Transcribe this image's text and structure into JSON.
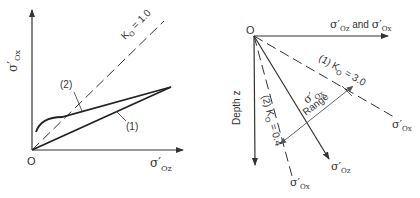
{
  "left_panel": {
    "y_axis_label": "σ′",
    "y_axis_sub": "Ox",
    "x_axis_label": "σ′",
    "x_axis_sub": "Oz",
    "origin_label": "O",
    "k0_line_label": "K",
    "k0_line_sub": "O",
    "k0_line_value": " = 1.0",
    "curve1_label": "(1)",
    "curve2_label": "(2)"
  },
  "right_panel": {
    "origin_label": "O",
    "horizontal_axis_label_a": "σ′",
    "horizontal_axis_sub_a": "Oz",
    "horizontal_axis_and": " and ",
    "horizontal_axis_label_b": "σ′",
    "horizontal_axis_sub_b": "Ox",
    "depth_label": "Depth  z",
    "line1_label": "(1) K",
    "line1_sub": "O",
    "line1_value": " = 3.0",
    "line2_label": "(2) K",
    "line2_sub": "O",
    "line2_value": " = 0.4",
    "end_label_line1": "σ′",
    "end_label_line1_sub": "Ox",
    "end_label_line2": "σ′",
    "end_label_line2_sub": "Ox",
    "end_label_oz": "σ′",
    "end_label_oz_sub": "Oz",
    "range_sym": "σ′",
    "range_sym_sub": "Ox",
    "range_label": "Range"
  },
  "colors": {
    "ink": "#333333",
    "background": "#ffffff"
  }
}
